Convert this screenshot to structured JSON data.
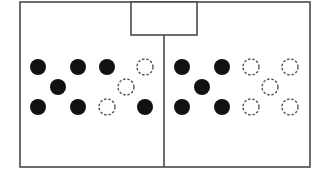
{
  "diagram": {
    "type": "field-formation",
    "colors": {
      "line": "#4a4a4a",
      "solid_player": "#111111",
      "empty_player_stroke": "#555555",
      "background": "#ffffff"
    },
    "field": {
      "x": 20,
      "y": 2,
      "width": 290,
      "height": 165
    },
    "goal_box": {
      "x": 131,
      "y": 2,
      "width": 66,
      "height": 33
    },
    "center_line": {
      "x": 164,
      "y1": 35,
      "y2": 167
    },
    "player_radius": 8,
    "left_half": {
      "players": [
        {
          "x": 38,
          "y": 67,
          "style": "solid"
        },
        {
          "x": 78,
          "y": 67,
          "style": "solid"
        },
        {
          "x": 107,
          "y": 67,
          "style": "solid"
        },
        {
          "x": 145,
          "y": 67,
          "style": "dashed"
        },
        {
          "x": 58,
          "y": 87,
          "style": "solid"
        },
        {
          "x": 126,
          "y": 87,
          "style": "dashed"
        },
        {
          "x": 38,
          "y": 107,
          "style": "solid"
        },
        {
          "x": 78,
          "y": 107,
          "style": "solid"
        },
        {
          "x": 107,
          "y": 107,
          "style": "dashed"
        },
        {
          "x": 145,
          "y": 107,
          "style": "solid"
        }
      ]
    },
    "right_half": {
      "players": [
        {
          "x": 182,
          "y": 67,
          "style": "solid"
        },
        {
          "x": 222,
          "y": 67,
          "style": "solid"
        },
        {
          "x": 251,
          "y": 67,
          "style": "dashed"
        },
        {
          "x": 290,
          "y": 67,
          "style": "dashed"
        },
        {
          "x": 202,
          "y": 87,
          "style": "solid"
        },
        {
          "x": 270,
          "y": 87,
          "style": "dashed"
        },
        {
          "x": 182,
          "y": 107,
          "style": "solid"
        },
        {
          "x": 222,
          "y": 107,
          "style": "solid"
        },
        {
          "x": 251,
          "y": 107,
          "style": "dashed"
        },
        {
          "x": 290,
          "y": 107,
          "style": "dashed"
        }
      ]
    }
  }
}
